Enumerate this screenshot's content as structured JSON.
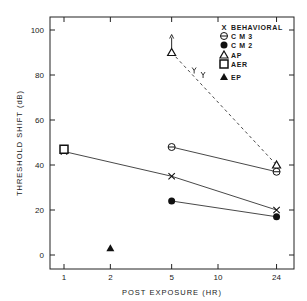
{
  "chart_data": {
    "type": "line",
    "title": "",
    "xlabel": "POST EXPOSURE (HR)",
    "ylabel": "THRESHOLD SHIFT (dB)",
    "x_scale": "log",
    "x_ticks": [
      1,
      2,
      5,
      10,
      24
    ],
    "y_ticks": [
      0,
      20,
      40,
      60,
      80,
      100
    ],
    "xlim": [
      0.8,
      30
    ],
    "ylim": [
      -6,
      106
    ],
    "grid": false,
    "legend_position": "upper right",
    "series": [
      {
        "name": "BEHAVIORAL",
        "marker": "x",
        "line": "solid",
        "x": [
          1,
          5,
          24
        ],
        "y": [
          46,
          35,
          20
        ]
      },
      {
        "name": "CM 3",
        "marker": "circle-bar",
        "line": "solid",
        "x": [
          5,
          24
        ],
        "y": [
          48,
          37
        ]
      },
      {
        "name": "CM 2",
        "marker": "filled-circle",
        "line": "solid",
        "x": [
          5,
          24
        ],
        "y": [
          24,
          17
        ]
      },
      {
        "name": "AP",
        "marker": "open-triangle",
        "line": "dashed",
        "x": [
          5,
          24
        ],
        "y": [
          90,
          40
        ],
        "annotation": "arrow up at 5 hr (exceeds 90 dB)"
      },
      {
        "name": "AER",
        "marker": "open-square",
        "line": "none",
        "x": [
          1
        ],
        "y": [
          47
        ]
      },
      {
        "name": "EP",
        "marker": "filled-triangle",
        "line": "none",
        "x": [
          2
        ],
        "y": [
          3
        ]
      }
    ],
    "extra_marks": [
      {
        "description": "behavioral-like marks along AP dashed line",
        "x": [
          7,
          8
        ],
        "y": [
          82,
          80
        ]
      }
    ]
  },
  "legend": {
    "items": [
      {
        "symbol": "X",
        "label": "BEHAVIORAL"
      },
      {
        "symbol": "⊖",
        "label": "C M 3"
      },
      {
        "symbol": "●",
        "label": "C M 2"
      },
      {
        "symbol": "△",
        "label": "AP"
      },
      {
        "symbol": "□",
        "label": "AER"
      },
      {
        "symbol": "▲",
        "label": "EP"
      }
    ]
  },
  "axes": {
    "xlabel": "POST EXPOSURE (HR)",
    "ylabel": "THRESHOLD SHIFT (dB)",
    "x_tick_labels": [
      "1",
      "2",
      "5",
      "10",
      "24"
    ],
    "y_tick_labels": [
      "0",
      "20",
      "40",
      "60",
      "80",
      "100"
    ]
  }
}
